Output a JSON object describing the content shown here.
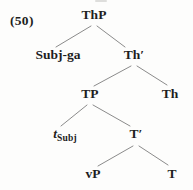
{
  "page": {
    "background_color": "#fdfdfc",
    "text_color": "#1e1e1e",
    "branch_line_color": "#8b8b8b"
  },
  "example_number": "(50)",
  "tree": {
    "type": "syntax-tree",
    "root": "ThP",
    "nodes": [
      {
        "id": "ThP",
        "label": "ThP"
      },
      {
        "id": "Subj-ga",
        "label": "Subj-ga"
      },
      {
        "id": "Th-bar",
        "label": "Th′"
      },
      {
        "id": "TP",
        "label": "TP"
      },
      {
        "id": "Th",
        "label": "Th"
      },
      {
        "id": "t-Subj",
        "main": "t",
        "sub": "Subj"
      },
      {
        "id": "T-bar",
        "label": "T′"
      },
      {
        "id": "vP",
        "label": "vP"
      },
      {
        "id": "T",
        "label": "T"
      }
    ],
    "edges": [
      {
        "from": "ThP",
        "to": "Subj-ga"
      },
      {
        "from": "ThP",
        "to": "Th-bar"
      },
      {
        "from": "Th-bar",
        "to": "TP"
      },
      {
        "from": "Th-bar",
        "to": "Th"
      },
      {
        "from": "TP",
        "to": "t-Subj"
      },
      {
        "from": "TP",
        "to": "T-bar"
      },
      {
        "from": "T-bar",
        "to": "vP"
      },
      {
        "from": "T-bar",
        "to": "T"
      }
    ]
  }
}
